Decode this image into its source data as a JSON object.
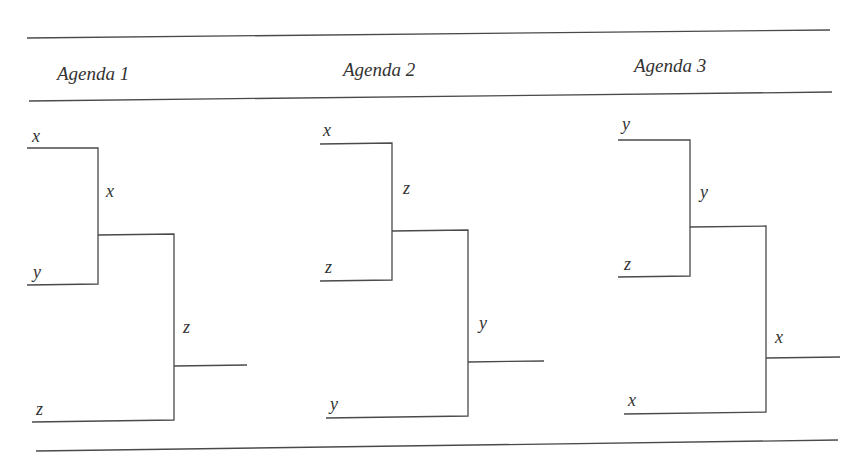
{
  "figure": {
    "columns": [
      {
        "header": "Agenda 1",
        "first_vote": {
          "options": [
            "x",
            "y"
          ],
          "winner": "x"
        },
        "second_vote": {
          "options": [
            "x",
            "z"
          ],
          "winner": "z"
        },
        "leaf_labels": [
          "x",
          "y",
          "z"
        ],
        "round1_label": "x",
        "final_label": "z"
      },
      {
        "header": "Agenda 2",
        "first_vote": {
          "options": [
            "x",
            "z"
          ],
          "winner": "z"
        },
        "second_vote": {
          "options": [
            "z",
            "y"
          ],
          "winner": "y"
        },
        "leaf_labels": [
          "x",
          "z",
          "y"
        ],
        "round1_label": "z",
        "final_label": "y"
      },
      {
        "header": "Agenda 3",
        "first_vote": {
          "options": [
            "y",
            "z"
          ],
          "winner": "y"
        },
        "second_vote": {
          "options": [
            "y",
            "x"
          ],
          "winner": "x"
        },
        "leaf_labels": [
          "y",
          "z",
          "x"
        ],
        "round1_label": "y",
        "final_label": "x"
      }
    ],
    "line_color": "#4a4a4a",
    "text_color": "#333333"
  }
}
